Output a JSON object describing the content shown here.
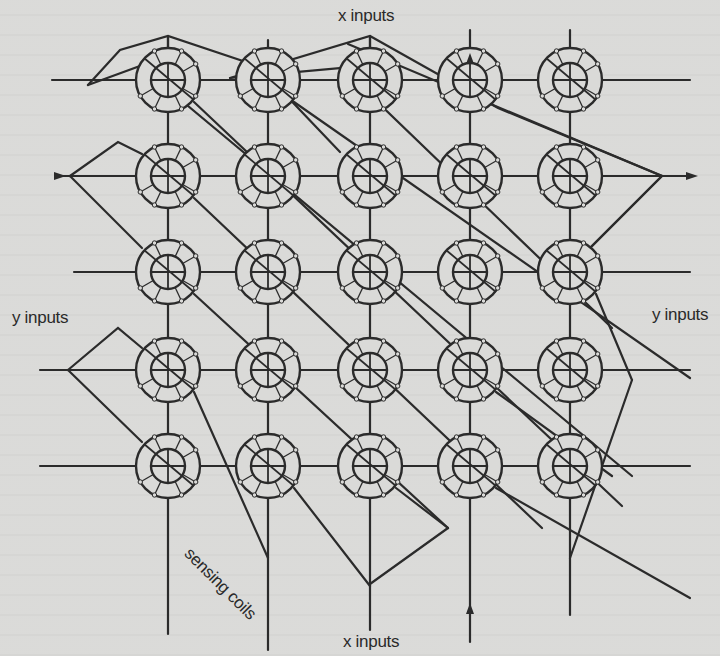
{
  "figure": {
    "labels": {
      "x_inputs_top": "x inputs",
      "x_inputs_bottom": "x inputs",
      "y_inputs_left": "y inputs",
      "y_inputs_right": "y inputs",
      "sensing_coils": "sensing coils"
    },
    "grid": {
      "rows": 5,
      "columns": 5,
      "column_x": [
        168,
        268,
        370,
        470,
        570
      ],
      "row_y": [
        80,
        176,
        272,
        370,
        466
      ],
      "core_outer_radius": 32,
      "core_inner_radius": 17
    },
    "icons": {
      "core": "toroidal-ferrite-core",
      "arrow": "signal-direction-arrow"
    },
    "colors": {
      "ink": "#2b2b2b",
      "paper": "#dadad8"
    }
  }
}
